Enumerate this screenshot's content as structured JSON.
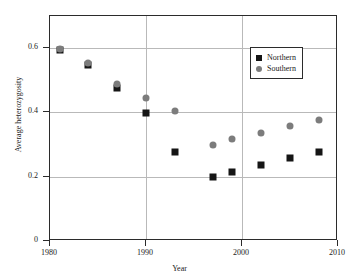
{
  "chart_data": {
    "type": "scatter",
    "title": "",
    "xlabel": "Year",
    "ylabel": "Average heterozygosity",
    "xlim": [
      1980,
      2010
    ],
    "ylim": [
      0,
      0.7
    ],
    "grid": true,
    "legend_position": "top-right",
    "xticks": [
      "1980",
      "1990",
      "2000",
      "2010"
    ],
    "xtick_values": [
      1980,
      1990,
      2000,
      2010
    ],
    "yticks": [
      "0",
      "0.2",
      "0.4",
      "0.6"
    ],
    "ytick_values": [
      0,
      0.2,
      0.4,
      0.6
    ],
    "series": [
      {
        "name": "Northern",
        "marker": "square",
        "color": "#151515",
        "x": [
          1981,
          1984,
          1987,
          1990,
          1993,
          1997,
          1999,
          2002,
          2005,
          2008
        ],
        "y": [
          0.595,
          0.548,
          0.477,
          0.399,
          0.278,
          0.199,
          0.216,
          0.236,
          0.259,
          0.278
        ]
      },
      {
        "name": "Southern",
        "marker": "circle",
        "color": "#7c7c7c",
        "x": [
          1981,
          1984,
          1987,
          1990,
          1993,
          1997,
          1999,
          2002,
          2005,
          2008
        ],
        "y": [
          0.597,
          0.553,
          0.488,
          0.446,
          0.406,
          0.3,
          0.318,
          0.336,
          0.359,
          0.375
        ]
      }
    ]
  },
  "legend": {
    "entries": [
      {
        "label": "Northern",
        "marker": "square"
      },
      {
        "label": "Southern",
        "marker": "circle"
      }
    ]
  }
}
